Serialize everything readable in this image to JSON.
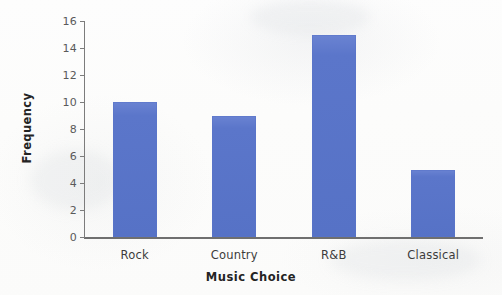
{
  "chart_data": {
    "type": "bar",
    "title": "",
    "categories": [
      "Rock",
      "Country",
      "R&B",
      "Classical"
    ],
    "values": [
      10,
      9,
      15,
      5
    ],
    "series": [
      {
        "name": "Frequency",
        "values": [
          10,
          9,
          15,
          5
        ]
      }
    ],
    "xlabel": "Music Choice",
    "ylabel": "Frequency",
    "ylim": [
      0,
      16
    ],
    "ytick_step": 2,
    "yticks": [
      0,
      2,
      4,
      6,
      8,
      10,
      12,
      14,
      16
    ],
    "ytick_labels": [
      "0",
      "2",
      "4",
      "6",
      "8",
      "10",
      "12",
      "14",
      "16"
    ],
    "grid": false,
    "legend": false,
    "legend_position": "none",
    "bar_color": "#5B76CA",
    "axis_color": "#6F6F6F",
    "tick_label_color": "#5A5A5A",
    "title_color": "#242424",
    "background_color": "#FCFCFB"
  }
}
